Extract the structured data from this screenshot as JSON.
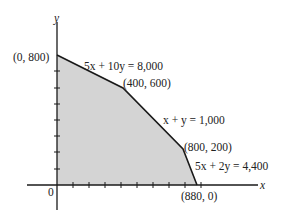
{
  "diagram": {
    "type": "feasible-region",
    "axes": {
      "x_label": "x",
      "y_label": "y",
      "origin_label": "0"
    },
    "region_fill": "#d4d4d4",
    "line_color": "#1a1a1a",
    "vertices": [
      {
        "label": "(0, 800)",
        "x": 0,
        "y": 800
      },
      {
        "label": "(400, 600)",
        "x": 400,
        "y": 600
      },
      {
        "label": "(800, 200)",
        "x": 800,
        "y": 200
      },
      {
        "label": "(880, 0)",
        "x": 880,
        "y": 0
      }
    ],
    "constraints": [
      {
        "label": "5x + 10y = 8,000"
      },
      {
        "label": "x + y = 1,000"
      },
      {
        "label": "5x + 2y = 4,400"
      }
    ],
    "tick_spacing": 100,
    "x_ticks": 9,
    "y_ticks": 7
  }
}
